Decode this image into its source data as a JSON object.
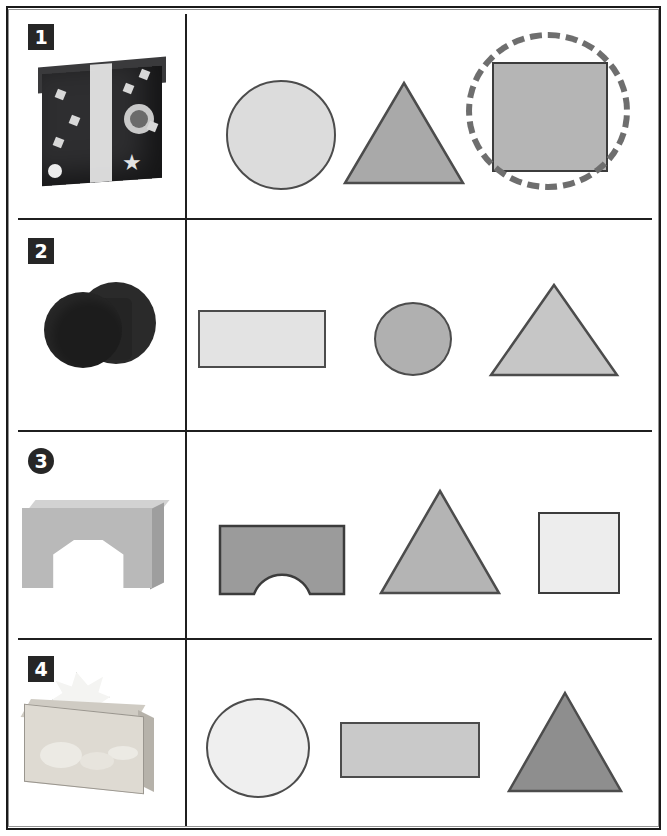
{
  "worksheet": {
    "title": "Match the object to its shapes",
    "page_width": 667,
    "page_height": 836,
    "rows": [
      {
        "number": "1",
        "badge_style": "square",
        "object": {
          "name": "gift-box-photo",
          "description": "black gift box with white ribbon and star stickers"
        },
        "shapes": [
          {
            "type": "circle",
            "fill": "#dcdcdc",
            "stroke": "#4c4c4c",
            "selected": false
          },
          {
            "type": "triangle",
            "fill": "#a9a9a9",
            "stroke": "#4c4c4c",
            "selected": false
          },
          {
            "type": "square",
            "fill": "#b5b5b5",
            "stroke": "#3c3c3c",
            "selected": true
          }
        ],
        "selection_marker": "dashed-circle"
      },
      {
        "number": "2",
        "badge_style": "square",
        "object": {
          "name": "round-black-box-photo",
          "description": "black cylindrical box lying on its side"
        },
        "shapes": [
          {
            "type": "rectangle",
            "fill": "#e3e3e3",
            "stroke": "#4c4c4c",
            "selected": false
          },
          {
            "type": "circle",
            "fill": "#b0b0b0",
            "stroke": "#4c4c4c",
            "selected": false
          },
          {
            "type": "triangle",
            "fill": "#c6c6c6",
            "stroke": "#4c4c4c",
            "selected": false
          }
        ],
        "selection_marker": "none"
      },
      {
        "number": "3",
        "badge_style": "circle",
        "object": {
          "name": "arch-block-photo",
          "description": "grey wooden arch building block"
        },
        "shapes": [
          {
            "type": "arch",
            "fill": "#9b9b9b",
            "stroke": "#3c3c3c",
            "selected": false
          },
          {
            "type": "triangle",
            "fill": "#b4b4b4",
            "stroke": "#4c4c4c",
            "selected": false
          },
          {
            "type": "square",
            "fill": "#ededed",
            "stroke": "#4c4c4c",
            "selected": false
          }
        ],
        "selection_marker": "none"
      },
      {
        "number": "4",
        "badge_style": "square",
        "object": {
          "name": "tissue-box-photo",
          "description": "floral patterned tissue box with tissue pulled out"
        },
        "shapes": [
          {
            "type": "circle",
            "fill": "#efefef",
            "stroke": "#4c4c4c",
            "selected": false
          },
          {
            "type": "rectangle",
            "fill": "#c9c9c9",
            "stroke": "#4c4c4c",
            "selected": false
          },
          {
            "type": "triangle",
            "fill": "#8e8e8e",
            "stroke": "#4c4c4c",
            "selected": false
          }
        ],
        "selection_marker": "none"
      }
    ],
    "colors": {
      "ink": "#1f1f1f",
      "badge_background": "#262626",
      "badge_text": "#ffffff",
      "selection_marker": "#6e6e6e",
      "page_background": "#ffffff"
    }
  }
}
